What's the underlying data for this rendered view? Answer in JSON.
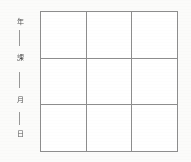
{
  "page": {
    "kind": "scanned-form-fragment",
    "background_color": "#fbfbfa",
    "ink_color": "#3a3a3a",
    "rule_color": "#8d8d8d"
  },
  "margin": {
    "labels": [
      {
        "text": "年",
        "top": 18
      },
      {
        "text": "課",
        "top": 54
      },
      {
        "text": "月",
        "top": 96
      },
      {
        "text": "日",
        "top": 130
      }
    ],
    "ticks": [
      {
        "top": 30,
        "height": 16
      },
      {
        "top": 72,
        "height": 16
      },
      {
        "top": 112,
        "height": 13
      }
    ]
  },
  "grid": {
    "rows": 3,
    "columns": 3,
    "cells": [
      [
        "",
        "",
        ""
      ],
      [
        "",
        "",
        ""
      ],
      [
        "",
        "",
        ""
      ]
    ]
  }
}
